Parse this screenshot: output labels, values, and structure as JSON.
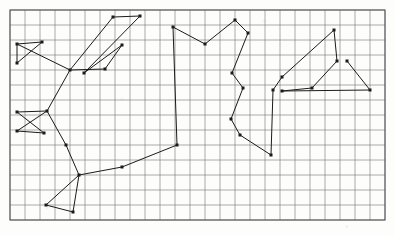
{
  "figure": {
    "background_color": "#fdfdfc",
    "width": 394,
    "height": 236
  },
  "grid": {
    "name": "graph-paper-grid",
    "origin_x": 10,
    "origin_y": 10,
    "cell_width": 15,
    "cell_height": 15,
    "columns": 25,
    "rows": 14,
    "line_color": "#6f6f72",
    "line_width": 0.8,
    "border_color": "#5a5a5e",
    "border_width": 1.1,
    "right_edge": 385,
    "bottom_edge": 220
  },
  "chart_data": {
    "type": "line",
    "xlabel": "",
    "ylabel": "",
    "grid": true,
    "legend": "none",
    "xlim": [
      10,
      385
    ],
    "ylim": [
      10,
      220
    ],
    "marker": "square",
    "marker_size": 3,
    "marker_color": "#1b1b1b",
    "line_color": "#1b1b1b",
    "line_width": 1.0,
    "series": [
      {
        "name": "path",
        "points": [
          [
            17,
            44
          ],
          [
            42,
            42
          ],
          [
            17,
            63
          ],
          [
            17,
            44
          ],
          [
            70,
            70
          ],
          [
            113,
            17
          ],
          [
            140,
            16
          ],
          [
            84,
            73
          ],
          [
            122,
            45
          ],
          [
            105,
            69
          ],
          [
            70,
            70
          ],
          [
            47,
            111
          ],
          [
            17,
            131
          ],
          [
            44,
            133
          ],
          [
            17,
            112
          ],
          [
            47,
            111
          ]
        ]
      },
      {
        "name": "path-continued",
        "points": [
          [
            47,
            111
          ],
          [
            66,
            145
          ],
          [
            79,
            175
          ],
          [
            46,
            205
          ],
          [
            73,
            212
          ],
          [
            79,
            175
          ],
          [
            122,
            167
          ],
          [
            177,
            145
          ],
          [
            173,
            27
          ],
          [
            205,
            44
          ],
          [
            235,
            20
          ],
          [
            248,
            33
          ],
          [
            232,
            73
          ],
          [
            243,
            88
          ],
          [
            231,
            119
          ],
          [
            240,
            135
          ],
          [
            271,
            155
          ],
          [
            273,
            90
          ],
          [
            282,
            77
          ],
          [
            334,
            30
          ],
          [
            337,
            61
          ],
          [
            312,
            88
          ],
          [
            282,
            91
          ],
          [
            370,
            90
          ],
          [
            347,
            61
          ]
        ]
      }
    ],
    "vertices": [
      {
        "id": "v1",
        "x": 17,
        "y": 44
      },
      {
        "id": "v2",
        "x": 42,
        "y": 42
      },
      {
        "id": "v3",
        "x": 17,
        "y": 63
      },
      {
        "id": "v4",
        "x": 70,
        "y": 70
      },
      {
        "id": "v5",
        "x": 113,
        "y": 17
      },
      {
        "id": "v6",
        "x": 140,
        "y": 16
      },
      {
        "id": "v7",
        "x": 84,
        "y": 73
      },
      {
        "id": "v8",
        "x": 122,
        "y": 45
      },
      {
        "id": "v9",
        "x": 105,
        "y": 69
      },
      {
        "id": "v10",
        "x": 47,
        "y": 111
      },
      {
        "id": "v11",
        "x": 17,
        "y": 131
      },
      {
        "id": "v12",
        "x": 44,
        "y": 133
      },
      {
        "id": "v13",
        "x": 17,
        "y": 112
      },
      {
        "id": "v14",
        "x": 66,
        "y": 145
      },
      {
        "id": "v15",
        "x": 79,
        "y": 175
      },
      {
        "id": "v16",
        "x": 46,
        "y": 205
      },
      {
        "id": "v17",
        "x": 73,
        "y": 212
      },
      {
        "id": "v18",
        "x": 122,
        "y": 167
      },
      {
        "id": "v19",
        "x": 177,
        "y": 145
      },
      {
        "id": "v20",
        "x": 173,
        "y": 27
      },
      {
        "id": "v21",
        "x": 205,
        "y": 44
      },
      {
        "id": "v22",
        "x": 235,
        "y": 20
      },
      {
        "id": "v23",
        "x": 248,
        "y": 33
      },
      {
        "id": "v24",
        "x": 232,
        "y": 73
      },
      {
        "id": "v25",
        "x": 243,
        "y": 88
      },
      {
        "id": "v26",
        "x": 231,
        "y": 119
      },
      {
        "id": "v27",
        "x": 240,
        "y": 135
      },
      {
        "id": "v28",
        "x": 271,
        "y": 155
      },
      {
        "id": "v29",
        "x": 273,
        "y": 90
      },
      {
        "id": "v30",
        "x": 282,
        "y": 77
      },
      {
        "id": "v31",
        "x": 334,
        "y": 30
      },
      {
        "id": "v32",
        "x": 337,
        "y": 61
      },
      {
        "id": "v33",
        "x": 312,
        "y": 88
      },
      {
        "id": "v34",
        "x": 282,
        "y": 91
      },
      {
        "id": "v35",
        "x": 370,
        "y": 90
      },
      {
        "id": "v36",
        "x": 347,
        "y": 61
      }
    ]
  }
}
